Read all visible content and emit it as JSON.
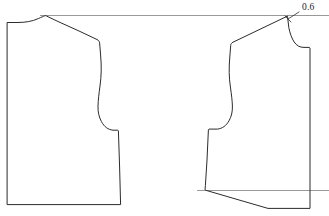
{
  "figure": {
    "type": "technical-pattern-draft",
    "width": 329,
    "height": 216,
    "background_color": "#ffffff"
  },
  "style": {
    "outline_color": "#2b2b2b",
    "outline_width": 1.0,
    "reference_color": "#8d8d8d",
    "reference_width": 0.9,
    "leader_color": "#2b2b2b",
    "leader_width": 0.8,
    "label_color": "#1a1a1a",
    "caption_color": "#3a3a3a"
  },
  "annotations": {
    "measurements": [
      {
        "id": "shoulder-raise",
        "value": "0.6",
        "x": 302,
        "y": 10,
        "anchor": "start",
        "leader": {
          "from_x": 299,
          "from_y": 12,
          "to_x": 288,
          "to_y": 19
        },
        "tick": {
          "x1": 285,
          "y1": 16,
          "x2": 291,
          "y2": 22
        }
      }
    ]
  },
  "reference_lines": [
    {
      "id": "upper-horizontal-baseline",
      "x1": 40,
      "y1": 15.5,
      "x2": 329,
      "y2": 15.5
    },
    {
      "id": "lower-horizontal-hemline",
      "x1": 197,
      "y1": 190.5,
      "x2": 329,
      "y2": 190.5
    }
  ],
  "pieces": [
    {
      "id": "left-bodice-block",
      "name": "left pattern block",
      "path": "M 7.5,22.5 L 17,22.5 C 25,22.5 32,21.5 38.5,18.5 C 41.5,17.2 43.2,16.4 44.5,15.9 L 45.5,15.6 L 46.5,16.0 L 58,21.5 L 79,31.0 L 97,39.5 C 98.6,40.3 99.4,41.3 99.6,42.8 L 100.6,55 C 101.6,66 101.4,76 100.0,86 C 98.9,94 98.2,100 98.0,106 C 97.8,112 99.0,117 101.4,121.5 C 104.2,126.8 108.0,129.6 113.0,130.2 L 117.8,130.2 L 118.4,130.8 L 119.6,167 L 120.6,204.6 L 7.5,204.6 Z"
    },
    {
      "id": "right-bodice-block",
      "name": "right pattern block",
      "path": "M 287.2,16.2 L 286.0,16.8 L 272,23.5 L 248,35.0 L 233,42.2 C 231.6,42.9 230.9,43.9 230.7,45.4 L 229.8,57 C 228.8,68 229.0,77.5 230.4,87 C 231.5,94.5 232.2,100.5 232.4,106 C 232.6,111.8 231.4,116.6 229.0,120.8 C 226.2,125.8 222.4,128.5 217.4,129.1 L 209.0,129.1 L 208.4,129.8 L 207.0,160 L 205.4,185.5 L 205.0,189.8 L 206.2,190.4 L 248,202.6 L 268,208.4 L 310,208.4 L 310,48.0 L 309.4,47.4 L 304,47.4 C 299.8,47.4 296.6,45.6 294.2,42.0 C 291.8,38.4 290.0,33.6 288.8,27.6 L 287.6,17.0 Z"
    }
  ],
  "caption": {
    "visible": false,
    "text": ""
  }
}
